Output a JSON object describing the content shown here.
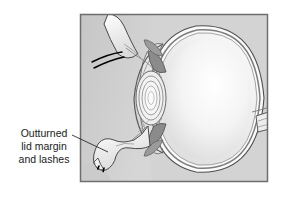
{
  "figure": {
    "name": "eye-sagittal-cross-section",
    "background_color": "#ffffff",
    "panel": {
      "name": "illustration-panel",
      "x": 80,
      "y": 14,
      "width": 188,
      "height": 168,
      "fill_color": "#d3d3d3",
      "border_color": "#6e6e6e",
      "border_width": 1.5
    }
  },
  "callout": {
    "name": "outturned-lid-callout",
    "lines": [
      "Outturned",
      "lid margin",
      "and lashes"
    ],
    "text_color": "#1a1a1a",
    "font_size": 10.5,
    "text_anchor_x": 44,
    "line_y": [
      137,
      150,
      163
    ],
    "leader": {
      "name": "callout-leader-line",
      "color": "#2b2b2b",
      "width": 0.9,
      "from_x": 72,
      "from_y": 135,
      "to_x": 108,
      "to_y": 152
    }
  },
  "anatomy": {
    "globe": {
      "name": "eye-globe",
      "label": "Globe of the eye",
      "fill_color": "#f2f2f2",
      "outline_color": "#4a4a4a",
      "layers": [
        "sclera",
        "choroid",
        "retina"
      ]
    },
    "cornea": {
      "name": "cornea",
      "label": "Cornea",
      "fill_color": "#e8e8e8",
      "outline_color": "#555555"
    },
    "lens": {
      "name": "crystalline-lens",
      "label": "Lens",
      "ring_count": 5,
      "fill_color": "#efefef",
      "outline_color": "#6b6b6b"
    },
    "iris": {
      "name": "iris-and-ciliary-body",
      "label": "Iris / ciliary body",
      "fill_color": "#8a8a8a",
      "outline_color": "#4a4a4a"
    },
    "anterior_chamber": {
      "name": "anterior-chamber",
      "label": "Anterior chamber",
      "fill_color": "#e4e4e4"
    },
    "vitreous": {
      "name": "vitreous-body",
      "label": "Vitreous body",
      "fill_color": "#f6f6f6"
    },
    "optic_nerve": {
      "name": "optic-nerve",
      "label": "Optic nerve",
      "fill_color": "#ededed",
      "outline_color": "#555555"
    },
    "upper_lid": {
      "name": "upper-eyelid",
      "label": "Upper eyelid",
      "fill_color": "#fbfbfb",
      "outline_color": "#4a4a4a",
      "lash_count": 2,
      "lash_color": "#000000"
    },
    "lower_lid": {
      "name": "lower-eyelid-outturned",
      "label": "Outturned lower eyelid",
      "fill_color": "#fbfbfb",
      "outline_color": "#4a4a4a",
      "lash_count": 2,
      "lash_color": "#000000"
    },
    "orbital_tissue": {
      "name": "orbital-soft-tissue",
      "label": "Periorbital soft tissue",
      "fill_color": "#c9c9c9"
    }
  }
}
